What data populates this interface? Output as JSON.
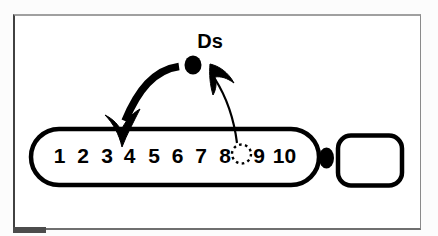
{
  "figure": {
    "element_label": "Ds",
    "segments": [
      "1",
      "2",
      "3",
      "4",
      "5",
      "6",
      "7",
      "8",
      "9",
      "10"
    ],
    "insertion_site_segment": "4",
    "excision_site_segment": "8",
    "colors": {
      "ink": "#000000",
      "background": "#ffffff",
      "frame_border": "#8a8a8a",
      "scan_mark": "#4c4c4c"
    },
    "icons": {
      "ds_element": "filled-circle-icon",
      "excision_site": "dashed-circle-icon",
      "centromere": "filled-circle-icon",
      "insertion_arrow": "thick-curved-arrow-down-icon",
      "excision_arrow": "thin-curved-arrow-up-icon"
    }
  }
}
